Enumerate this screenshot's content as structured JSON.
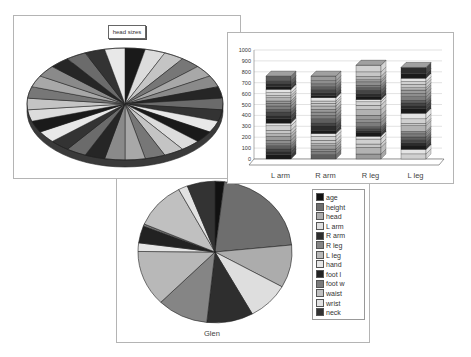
{
  "chart_data": [
    {
      "type": "pie",
      "title": "head sizes",
      "style": "3d",
      "slice_count": 30,
      "note": "Many equal-ish wedges in alternating grayscale shades; individual values not labeled",
      "colors": [
        "#1a1a1a",
        "#6b6b6b",
        "#a8a8a8",
        "#dcdcdc",
        "#333333",
        "#8a8a8a",
        "#c4c4c4",
        "#e8e8e8",
        "#262626",
        "#777777"
      ]
    },
    {
      "type": "bar",
      "stacked": true,
      "style": "3d",
      "categories": [
        "L arm",
        "R arm",
        "R leg",
        "L leg"
      ],
      "totals": [
        760,
        760,
        860,
        840
      ],
      "ylim": [
        0,
        1000
      ],
      "yticks": [
        "0",
        "100",
        "200",
        "300",
        "400",
        "500",
        "600",
        "700",
        "800",
        "900",
        "1000"
      ],
      "grid": true,
      "xlabel": "",
      "ylabel": "",
      "stripe_segments": {
        "L arm": [
          40,
          30,
          20,
          30,
          20,
          30,
          35,
          25,
          30,
          40,
          25,
          40,
          30,
          30,
          25,
          30,
          25,
          20,
          30,
          20,
          25,
          30,
          25,
          25,
          30,
          40
        ],
        "R arm": [
          40,
          30,
          20,
          30,
          20,
          30,
          35,
          25,
          30,
          40,
          25,
          40,
          30,
          30,
          25,
          30,
          25,
          20,
          30,
          20,
          25,
          30,
          25,
          25,
          30,
          40
        ],
        "R leg": [
          45,
          60,
          30,
          45,
          25,
          30,
          20,
          20,
          15,
          40,
          25,
          40,
          50,
          40,
          30,
          20,
          25,
          30,
          30,
          25,
          20,
          30,
          20,
          30,
          40,
          60
        ],
        "L leg": [
          45,
          40,
          30,
          30,
          25,
          25,
          20,
          15,
          15,
          50,
          20,
          40,
          50,
          40,
          30,
          20,
          25,
          30,
          30,
          30,
          20,
          30,
          25,
          30,
          40,
          55
        ]
      }
    },
    {
      "type": "pie",
      "title": "Glen",
      "categories": [
        "age",
        "height",
        "head",
        "L arm",
        "R arm",
        "R leg",
        "L leg",
        "hand",
        "foot l",
        "foot w",
        "waist",
        "wrist",
        "neck"
      ],
      "values": [
        2,
        22,
        10,
        9,
        10,
        11,
        13,
        2,
        4,
        0.5,
        11,
        2,
        6
      ],
      "colors": [
        "#111111",
        "#6e6e6e",
        "#acacac",
        "#dedede",
        "#2e2e2e",
        "#858585",
        "#b8b8b8",
        "#e6e6e6",
        "#222222",
        "#7a7a7a",
        "#c0c0c0",
        "#e2e2e2",
        "#333333"
      ],
      "legend_position": "right"
    }
  ],
  "windows": {
    "head": {
      "title": "head sizes"
    },
    "bar": {
      "categories": [
        "L arm",
        "R arm",
        "R leg",
        "L leg"
      ],
      "yticks": [
        "0",
        "100",
        "200",
        "300",
        "400",
        "500",
        "600",
        "700",
        "800",
        "900",
        "1000"
      ]
    },
    "glen": {
      "label": "Glen",
      "legend": [
        "age",
        "height",
        "head",
        "L arm",
        "R arm",
        "R leg",
        "L leg",
        "hand",
        "foot l",
        "foot w",
        "waist",
        "wrist",
        "neck"
      ]
    }
  }
}
